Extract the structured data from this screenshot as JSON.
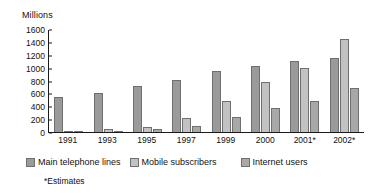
{
  "chart_data": {
    "type": "bar",
    "title": "",
    "subtitle": "",
    "xlabel": "",
    "ylabel": "Millions",
    "ylim": [
      0,
      1600
    ],
    "yticks": [
      0,
      200,
      400,
      600,
      800,
      1000,
      1200,
      1400,
      1600
    ],
    "grid": false,
    "legend_position": "bottom",
    "categories": [
      "1991",
      "1993",
      "1995",
      "1997",
      "1999",
      "2000",
      "2001*",
      "2002*"
    ],
    "series": [
      {
        "name": "Main telephone lines",
        "color": "#9a9a9a",
        "values": [
          550,
          610,
          715,
          805,
          955,
          1020,
          1100,
          1150
        ]
      },
      {
        "name": "Mobile subscribers",
        "color": "#c2c2c2",
        "values": [
          20,
          40,
          85,
          215,
          485,
          775,
          1000,
          1440
        ]
      },
      {
        "name": "Internet users",
        "color": "#a8a8a8",
        "values": [
          5,
          20,
          40,
          100,
          235,
          375,
          480,
          690
        ]
      }
    ],
    "annotations": [
      "*Estimates"
    ]
  },
  "axis": {
    "y_title": "Millions"
  },
  "footnote": {
    "text": "*Estimates"
  }
}
